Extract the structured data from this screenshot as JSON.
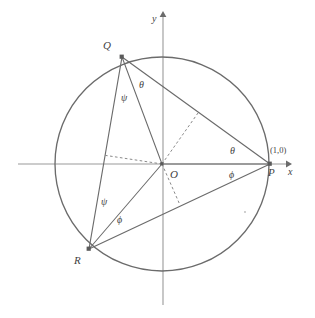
{
  "figure": {
    "type": "geometry-diagram",
    "background": "#ffffff",
    "stroke_color": "#6b6b6b",
    "dash_color": "#8a8a8a",
    "axis_color": "#9a9a9a",
    "text_color": "#3f3f3f"
  },
  "axes": {
    "x_label": "x",
    "y_label": "y",
    "x_start": [
      18,
      164
    ],
    "x_end": [
      289,
      164
    ],
    "y_start": [
      163,
      305
    ],
    "y_end": [
      163,
      14
    ]
  },
  "circle": {
    "center": [
      162,
      164
    ],
    "radius": 107
  },
  "points": [
    {
      "id": "O",
      "label": "O",
      "x": 162,
      "y": 164,
      "label_x": 170,
      "label_y": 170,
      "marker": false
    },
    {
      "id": "P",
      "label": "P",
      "x": 270,
      "y": 164,
      "label_x": 268,
      "label_y": 168,
      "marker": true
    },
    {
      "id": "Q",
      "label": "Q",
      "x": 122,
      "y": 57,
      "label_x": 103,
      "label_y": 40,
      "marker": true
    },
    {
      "id": "R",
      "label": "R",
      "x": 89,
      "y": 249,
      "label_x": 74,
      "label_y": 255,
      "marker": true
    }
  ],
  "coordinate_label": {
    "text": "(1,0)",
    "x": 272,
    "y": 147
  },
  "angle_labels": [
    {
      "id": "theta-at-Q",
      "text": "θ",
      "x": 139,
      "y": 80
    },
    {
      "id": "psi-at-Q",
      "text": "ψ",
      "x": 121,
      "y": 93
    },
    {
      "id": "theta-at-P-upper",
      "text": "θ",
      "x": 230,
      "y": 146
    },
    {
      "id": "phi-at-P-lower",
      "text": "ϕ",
      "x": 229,
      "y": 170
    },
    {
      "id": "psi-at-R",
      "text": "ψ",
      "x": 101,
      "y": 197
    },
    {
      "id": "phi-at-R",
      "text": "ϕ",
      "x": 117,
      "y": 215
    }
  ],
  "segments": [
    {
      "id": "QP",
      "from": [
        122,
        57
      ],
      "to": [
        270,
        164
      ],
      "style": "solid"
    },
    {
      "id": "RP",
      "from": [
        89,
        249
      ],
      "to": [
        270,
        164
      ],
      "style": "solid"
    },
    {
      "id": "QR",
      "from": [
        122,
        57
      ],
      "to": [
        89,
        249
      ],
      "style": "solid"
    },
    {
      "id": "OQ",
      "from": [
        162,
        164
      ],
      "to": [
        122,
        57
      ],
      "style": "solid"
    },
    {
      "id": "OR",
      "from": [
        162,
        164
      ],
      "to": [
        89,
        249
      ],
      "style": "solid"
    },
    {
      "id": "OP",
      "from": [
        162,
        164
      ],
      "to": [
        270,
        164
      ],
      "style": "solid"
    },
    {
      "id": "perp-to-QR",
      "from": [
        162,
        164
      ],
      "to": [
        103,
        155
      ],
      "style": "dashed"
    },
    {
      "id": "perp-to-QP",
      "from": [
        162,
        164
      ],
      "to": [
        198,
        113
      ],
      "style": "dashed"
    },
    {
      "id": "perp-to-RP",
      "from": [
        162,
        164
      ],
      "to": [
        180,
        205
      ],
      "style": "dashed"
    }
  ],
  "stray_dot": {
    "x": 245,
    "y": 212
  }
}
